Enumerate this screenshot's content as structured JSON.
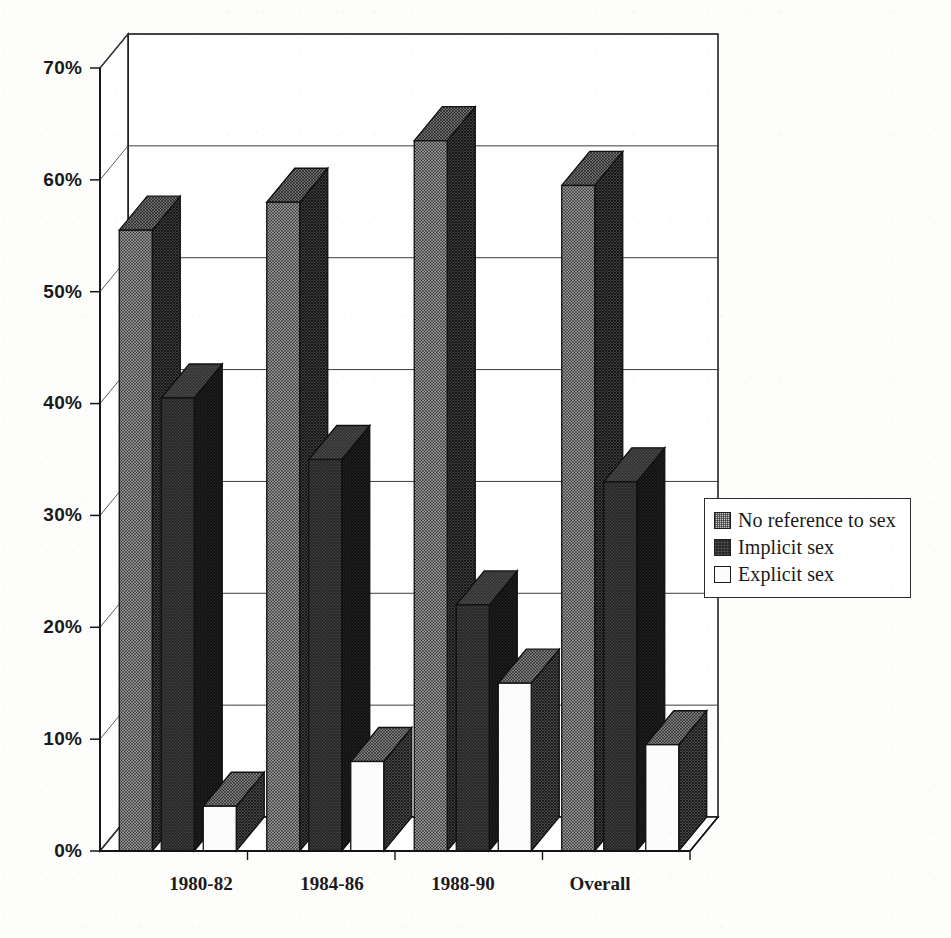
{
  "chart_data": {
    "type": "bar",
    "title": "",
    "subtitle": "",
    "xlabel": "",
    "ylabel": "",
    "categories": [
      "1980-82",
      "1984-86",
      "1988-90",
      "Overall"
    ],
    "series": [
      {
        "name": "No reference to sex",
        "values": [
          55.5,
          58.0,
          63.5,
          59.5
        ],
        "pattern": "medium-dither",
        "color": "#c9c9c9"
      },
      {
        "name": "Implicit sex",
        "values": [
          40.5,
          35.0,
          22.0,
          33.0
        ],
        "pattern": "dark-dither",
        "color": "#262626"
      },
      {
        "name": "Explicit sex",
        "values": [
          4.0,
          8.0,
          15.0,
          9.5
        ],
        "pattern": "solid-white",
        "color": "#fbfbfb"
      }
    ],
    "ylim": [
      0,
      70
    ],
    "yticks": [
      "0%",
      "10%",
      "20%",
      "30%",
      "40%",
      "50%",
      "60%",
      "70%"
    ],
    "ytick_values": [
      0,
      10,
      20,
      30,
      40,
      50,
      60,
      70
    ],
    "grid": true,
    "grid_axis": "y",
    "legend_position": "right",
    "three_d": true,
    "units": "percent"
  },
  "legend": {
    "items": [
      {
        "label": "No reference to sex",
        "swatch": "pattern-medium-dither"
      },
      {
        "label": "Implicit sex",
        "swatch": "pattern-dark-dither"
      },
      {
        "label": "Explicit sex",
        "swatch": "pattern-white"
      }
    ]
  },
  "axes": {
    "y_tick_labels": [
      "70%",
      "60%",
      "50%",
      "40%",
      "30%",
      "20%",
      "10%",
      "0%"
    ],
    "x_tick_labels": [
      "1980-82",
      "1984-86",
      "1988-90",
      "Overall"
    ]
  }
}
